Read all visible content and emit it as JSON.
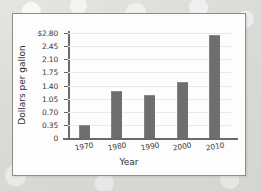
{
  "chart_data": {
    "type": "bar",
    "title": "",
    "xlabel": "Year",
    "ylabel": "Dollars per gallon",
    "categories": [
      "1970",
      "1980",
      "1990",
      "2000",
      "2010"
    ],
    "values": [
      0.35,
      1.25,
      1.15,
      1.5,
      2.75
    ],
    "ylim": [
      0,
      2.8
    ],
    "ytick_values": [
      0,
      0.35,
      0.7,
      1.05,
      1.4,
      1.75,
      2.1,
      2.45,
      2.8
    ],
    "ytick_labels": [
      "0",
      "0.35",
      "0.70",
      "1.05",
      "1.40",
      "1.75",
      "2.10",
      "2.45",
      "$2.80"
    ],
    "grid": true,
    "legend": false,
    "legend_position": "none",
    "bar_color": "#6e6e6e",
    "gridline_color": "#e9e9e9",
    "axis_color": "#6a6a6a",
    "plot_background": "#fdfdfd",
    "page_background": "#dcdcda"
  }
}
